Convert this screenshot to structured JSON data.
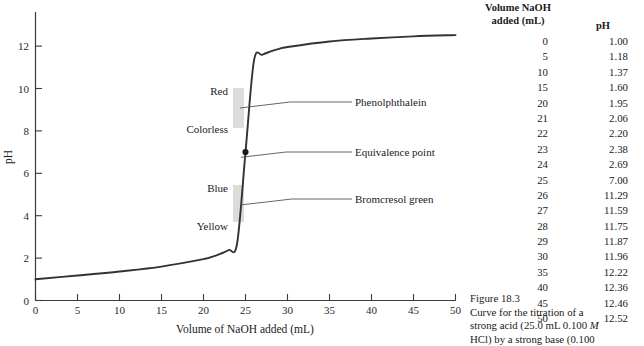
{
  "chart_data": {
    "type": "line",
    "title": "",
    "xlabel": "Volume of NaOH added (mL)",
    "ylabel": "pH",
    "xlim": [
      0,
      50
    ],
    "ylim": [
      0,
      13
    ],
    "xticks": [
      0,
      5,
      10,
      15,
      20,
      25,
      30,
      35,
      40,
      45,
      50
    ],
    "yticks": [
      0,
      2,
      4,
      6,
      8,
      10,
      12
    ],
    "grid": false,
    "legend": "none",
    "x": [
      0,
      5,
      10,
      15,
      20,
      21,
      22,
      23,
      24,
      25,
      26,
      27,
      28,
      29,
      30,
      35,
      40,
      45,
      50
    ],
    "y": [
      1.0,
      1.18,
      1.37,
      1.6,
      1.95,
      2.06,
      2.2,
      2.38,
      2.69,
      7.0,
      11.29,
      11.59,
      11.75,
      11.87,
      11.96,
      12.22,
      12.36,
      12.46,
      12.52
    ],
    "equivalence_point": {
      "x": 25,
      "y": 7.0,
      "label": "Equivalence point"
    },
    "annotations": [
      {
        "label": "Red",
        "x": 25,
        "y": 10.2
      },
      {
        "label": "Colorless",
        "x": 25,
        "y": 8.6
      },
      {
        "label": "Phenolphthalein",
        "x": 25,
        "y": 9.4
      },
      {
        "label": "Blue",
        "x": 25,
        "y": 5.0
      },
      {
        "label": "Yellow",
        "x": 25,
        "y": 3.3
      },
      {
        "label": "Bromcresol green",
        "x": 25,
        "y": 4.1
      }
    ],
    "indicator_bands": [
      {
        "name": "phenolphthalein-band",
        "ph_low": 8.2,
        "ph_high": 10.0,
        "color": "#d9d9d9"
      },
      {
        "name": "bromcresol-green-band",
        "ph_low": 3.8,
        "ph_high": 5.4,
        "color": "#d9d9d9"
      }
    ],
    "curve_color": "#333333"
  },
  "table": {
    "header": {
      "volume_line1": "Volume NaOH",
      "volume_line2": "added (mL)",
      "ph": "pH"
    },
    "rows": [
      {
        "volume": "0",
        "ph": "1.00"
      },
      {
        "volume": "5",
        "ph": "1.18"
      },
      {
        "volume": "10",
        "ph": "1.37"
      },
      {
        "volume": "15",
        "ph": "1.60"
      },
      {
        "volume": "20",
        "ph": "1.95"
      },
      {
        "volume": "21",
        "ph": "2.06"
      },
      {
        "volume": "22",
        "ph": "2.20"
      },
      {
        "volume": "23",
        "ph": "2.38"
      },
      {
        "volume": "24",
        "ph": "2.69"
      },
      {
        "volume": "25",
        "ph": "7.00"
      },
      {
        "volume": "26",
        "ph": "11.29"
      },
      {
        "volume": "27",
        "ph": "11.59"
      },
      {
        "volume": "28",
        "ph": "11.75"
      },
      {
        "volume": "29",
        "ph": "11.87"
      },
      {
        "volume": "30",
        "ph": "11.96"
      },
      {
        "volume": "35",
        "ph": "12.22"
      },
      {
        "volume": "40",
        "ph": "12.36"
      },
      {
        "volume": "45",
        "ph": "12.46"
      },
      {
        "volume": "50",
        "ph": "12.52"
      }
    ]
  },
  "caption": {
    "number": "Figure 18.3",
    "line1": "Curve for the titration of a",
    "line2_a": "strong acid (25.0 mL 0.100 ",
    "line2_italic": "M",
    "line3": "HCl) by a strong base (0.100"
  },
  "axis": {
    "xticks": [
      "0",
      "5",
      "10",
      "15",
      "20",
      "25",
      "30",
      "35",
      "40",
      "45",
      "50"
    ],
    "yticks": [
      "0",
      "2",
      "4",
      "6",
      "8",
      "10",
      "12"
    ],
    "xlabel": "Volume of NaOH added (mL)",
    "ylabel": "pH"
  },
  "labels": {
    "red": "Red",
    "colorless": "Colorless",
    "phenolphthalein": "Phenolphthalein",
    "equivalence_point": "Equivalence point",
    "blue": "Blue",
    "yellow": "Yellow",
    "bromcresol_green": "Bromcresol green"
  }
}
